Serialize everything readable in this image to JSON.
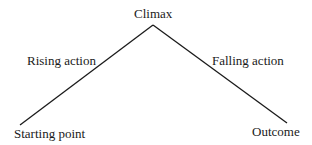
{
  "diagram": {
    "type": "plot-structure-triangle",
    "nodes": {
      "apex": {
        "label": "Climax"
      },
      "start": {
        "label": "Starting point"
      },
      "end": {
        "label": "Outcome"
      }
    },
    "edges": {
      "left": {
        "label": "Rising action"
      },
      "right": {
        "label": "Falling action"
      }
    },
    "colors": {
      "line": "#1a1a1a",
      "text": "#1a1a1a",
      "background": "#ffffff"
    }
  }
}
